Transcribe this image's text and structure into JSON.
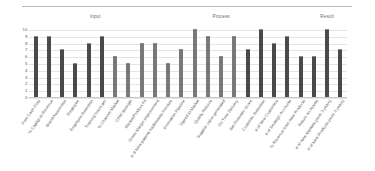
{
  "chart_data": {
    "type": "bar",
    "title": "",
    "xlabel": "",
    "ylabel": "",
    "ylim": [
      0,
      10
    ],
    "grid": true,
    "legend": "none",
    "yticks": [
      "10",
      "9",
      "8",
      "7",
      "6",
      "5",
      "4",
      "3",
      "2",
      "1",
      "0"
    ],
    "group_headers": [
      {
        "label": "Input",
        "start_index": 0,
        "end_index": 9
      },
      {
        "label": "Process",
        "start_index": 10,
        "end_index": 18
      },
      {
        "label": "Result",
        "start_index": 19,
        "end_index": 25
      }
    ],
    "categories": [
      "Free Cash Flow",
      "% Capital to Revenue",
      "Brand Awareness",
      "Employee",
      "Employee Retention",
      "Training hours per",
      "% Channel Market",
      "CRM Strength",
      "Market/Product Fit",
      "Gross Margin Improvement",
      "# of New patents trademarks licenses",
      "Innovation Pipeline",
      "Speed to Market",
      "Quality Returns",
      "Supplier value generated",
      "On Time Delivery",
      "Net Promoter Score",
      "Customer Retention",
      "# of New Customers",
      "# of Strategic Accounts",
      "% Revenue from New Products",
      "Return on Assets",
      "# of New Markets (over 3 years)",
      "# of New Products (over 3 years)"
    ],
    "values": [
      9,
      9,
      7,
      5,
      8,
      9,
      6,
      5,
      8,
      8,
      5,
      7,
      10,
      9,
      6,
      9,
      7,
      10,
      8,
      9,
      6,
      6,
      10,
      7
    ],
    "bar_shades": [
      "dark",
      "dark",
      "dark",
      "dark",
      "dark",
      "dark",
      "light",
      "light",
      "light",
      "light",
      "light",
      "light",
      "light",
      "light",
      "light",
      "light",
      "dark",
      "dark",
      "dark",
      "dark",
      "dark",
      "dark",
      "dark",
      "dark"
    ],
    "colors": {
      "bar_dark": "#4a4a4a",
      "bar_light": "#787878",
      "gridline": "#e4e4e4",
      "axis": "#c9c9c9",
      "text": "#5e5e5e",
      "background": "#ffffff"
    }
  }
}
